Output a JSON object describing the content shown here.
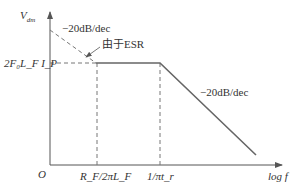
{
  "diagram": {
    "type": "bode-asymptote",
    "y_axis_label": "V",
    "y_axis_subscript": "dm",
    "x_axis_label": "log f",
    "origin_label": "O",
    "y_level_label": "2F₀L_F I_P",
    "x_tick_1": "R_F/2πL_F",
    "x_tick_2": "1/πt_r",
    "slope_label_left": "−20dB/dec",
    "slope_label_right": "−20dB/dec",
    "annotation": "由于ESR",
    "line_color": "#666666"
  }
}
